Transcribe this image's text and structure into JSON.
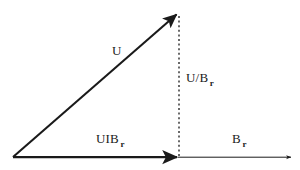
{
  "figure": {
    "background_color": "#ffffff",
    "stroke_color": "#1a1a1a",
    "width": 300,
    "height": 170
  },
  "labels": {
    "hypotenuse": {
      "base": "U",
      "sub": ""
    },
    "vertical": {
      "base": "U/B",
      "sub": "r"
    },
    "horizontal": {
      "base": "UIB",
      "sub": "r"
    },
    "axis": {
      "base": "B",
      "sub": "r"
    }
  },
  "geometry": {
    "origin": {
      "x": 13,
      "y": 157
    },
    "apex": {
      "x": 178,
      "y": 13
    },
    "foot": {
      "x": 178,
      "y": 157
    },
    "axis_end": {
      "x": 292,
      "y": 157
    }
  }
}
